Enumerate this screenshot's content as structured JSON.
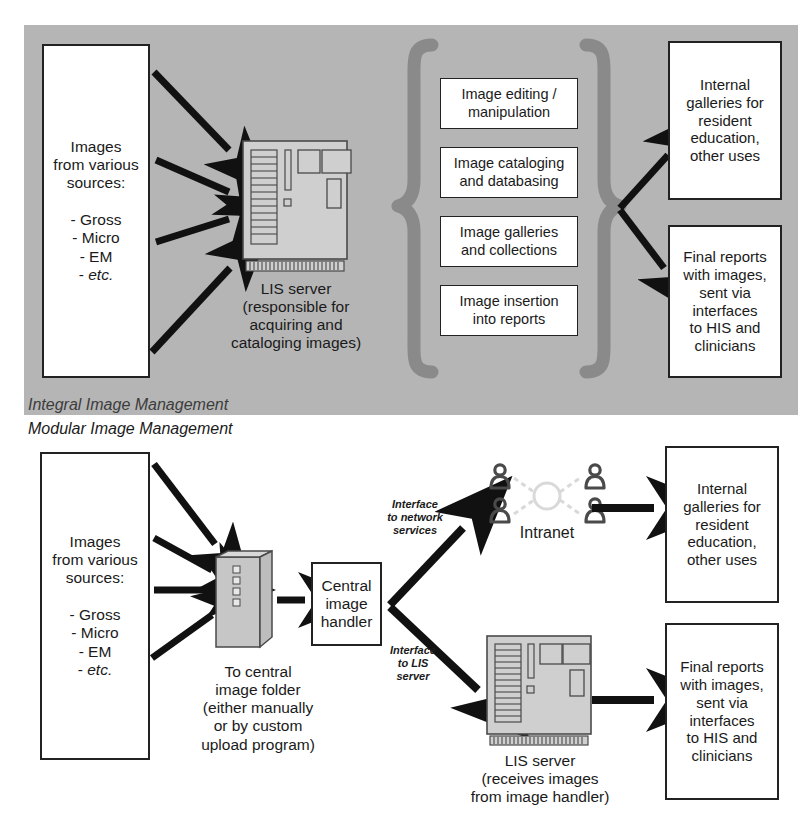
{
  "figure": {
    "colors": {
      "panel_gray": "#b5b5b5",
      "brace_gray": "#8a8a8a",
      "box_fill": "#ffffff",
      "box_border": "#222222",
      "arrow_black": "#111111",
      "server_fill": "#cfcfcf",
      "server_line": "#4a4a4a",
      "network_line": "#d9d9d9"
    }
  },
  "captions": {
    "integral": "Integral Image Management",
    "modular": "Modular Image Management"
  },
  "integral": {
    "sources_box": "Images\nfrom various\nsources:\n\n- Gross\n- Micro\n- EM\n- etc.",
    "sources_lines": [
      "Images",
      "from various",
      "sources:",
      "",
      "- Gross",
      "- Micro",
      "- EM",
      "- etc."
    ],
    "server_icon_name": "lis-server-icon",
    "server_caption": "LIS server\n(responsible for\nacquiring and\ncataloging images)",
    "server_caption_lines": [
      "LIS server",
      "(responsible for",
      "acquiring and",
      "cataloging images)"
    ],
    "functions": [
      "Image editing /\nmanipulation",
      "Image cataloging\nand databasing",
      "Image galleries\nand collections",
      "Image insertion\ninto reports"
    ],
    "outputs": [
      "Internal\ngalleries for\nresident\neducation,\nother uses",
      "Final reports\nwith images,\nsent via\ninterfaces\nto HIS and\nclinicians"
    ]
  },
  "modular": {
    "sources_box": "Images\nfrom various\nsources:\n\n- Gross\n- Micro\n- EM\n- etc.",
    "sources_lines": [
      "Images",
      "from various",
      "sources:",
      "",
      "- Gross",
      "- Micro",
      "- EM",
      "- etc."
    ],
    "folder_icon_name": "central-image-folder-icon",
    "folder_caption": "To central\nimage folder\n(either manually\nor by custom\nupload program)",
    "folder_caption_lines": [
      "To central",
      "image folder",
      "(either manually",
      "or by custom",
      "upload program)"
    ],
    "handler_box": "Central\nimage\nhandler",
    "handler_lines": [
      "Central",
      "image",
      "handler"
    ],
    "interface_network": "Interface\nto network\nservices",
    "interface_network_lines": [
      "Interface",
      "to network",
      "services"
    ],
    "interface_lis": "Interface\nto LIS\nserver",
    "interface_lis_lines": [
      "Interface",
      "to LIS",
      "server"
    ],
    "intranet_icon_name": "intranet-network-icon",
    "intranet_caption": "Intranet",
    "server_icon_name": "lis-server-icon",
    "server_caption": "LIS server\n(receives images\nfrom image handler)",
    "server_caption_lines": [
      "LIS server",
      "(receives images",
      "from image handler)"
    ],
    "outputs": [
      "Internal\ngalleries for\nresident\neducation,\nother uses",
      "Final reports\nwith images,\nsent via\ninterfaces\nto HIS and\nclinicians"
    ]
  }
}
